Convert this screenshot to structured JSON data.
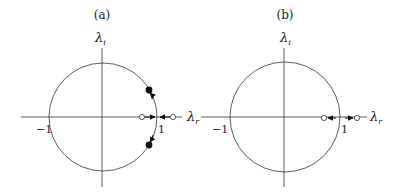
{
  "panels": [
    {
      "id": "a",
      "label": "(a)",
      "y_axis_label": "λ",
      "y_axis_sub": "i",
      "x_axis_label": "λ",
      "x_axis_sub": "r",
      "tick_neg": "−1",
      "tick_pos": "1",
      "description": "Complex-conjugate pair of eigenvalues moving along the unit circle; two real eigenvalues converging toward 1"
    },
    {
      "id": "b",
      "label": "(b)",
      "y_axis_label": "λ",
      "y_axis_sub": "i",
      "x_axis_label": "λ",
      "x_axis_sub": "r",
      "tick_neg": "−1",
      "tick_pos": "1",
      "description": "Two real eigenvalues separating away from 1 along the real axis"
    }
  ],
  "colors": {
    "stroke": "#333333",
    "fill": "#111111",
    "background": "#ffffff"
  }
}
